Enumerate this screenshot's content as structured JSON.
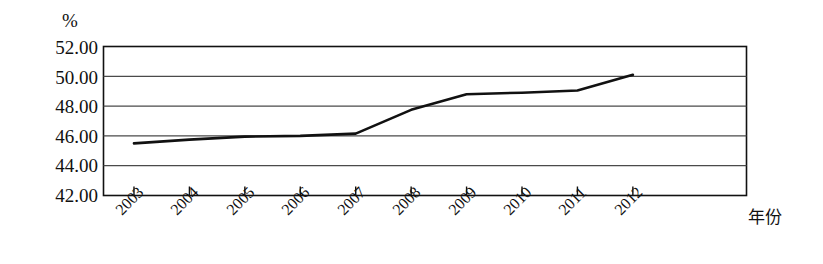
{
  "chart_data": {
    "type": "line",
    "title": "",
    "subtitle": "",
    "xlabel": "年份",
    "ylabel": "%",
    "unit_label": "%",
    "categories": [
      "2003",
      "2004",
      "2005",
      "2006",
      "2007",
      "2008",
      "2009",
      "2010",
      "2011",
      "2012"
    ],
    "values": [
      45.5,
      45.75,
      45.95,
      46.0,
      46.15,
      47.75,
      48.8,
      48.9,
      49.05,
      50.1
    ],
    "series": [
      {
        "name": "",
        "values": [
          45.5,
          45.75,
          45.95,
          46.0,
          46.15,
          47.75,
          48.8,
          48.9,
          49.05,
          50.1
        ]
      }
    ],
    "ylim": [
      42.0,
      52.0
    ],
    "ytick_labels": [
      "52.00",
      "50.00",
      "48.00",
      "46.00",
      "44.00",
      "42.00"
    ],
    "ytick_values": [
      52.0,
      50.0,
      48.0,
      46.0,
      44.0,
      42.0
    ],
    "grid": true,
    "grid_axis": "y",
    "legend": false,
    "legend_position": "none",
    "line_color": "#111111",
    "grid_color": "#4a4a4a",
    "axis_color": "#111111",
    "background": "#ffffff",
    "annotations": []
  }
}
